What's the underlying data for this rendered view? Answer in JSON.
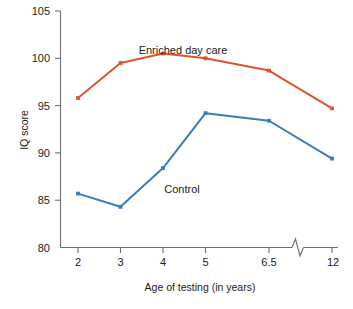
{
  "chart_data": {
    "type": "line",
    "title": "",
    "xlabel": "Age of testing (in years)",
    "ylabel": "IQ score",
    "categories": [
      "2",
      "3",
      "4",
      "5",
      "6.5",
      "12"
    ],
    "x_tick_labels": [
      "2",
      "3",
      "4",
      "5",
      "6.5",
      "12"
    ],
    "y_tick_labels": [
      "80",
      "85",
      "90",
      "95",
      "100",
      "105"
    ],
    "y_ticks": [
      80,
      85,
      90,
      95,
      100,
      105
    ],
    "ylim": [
      80,
      105
    ],
    "grid": false,
    "legend_position": "inline-annotation",
    "axis_break": "between 6.5 and 12 on x-axis",
    "series": [
      {
        "name": "Enriched day care",
        "color": "#e0522c",
        "values": [
          95.8,
          99.5,
          100.5,
          100.0,
          98.7,
          94.7
        ],
        "label_text": "Enriched day care"
      },
      {
        "name": "Control",
        "color": "#3a7cb8",
        "values": [
          85.7,
          84.3,
          88.4,
          94.2,
          93.4,
          89.4
        ],
        "label_text": "Control"
      }
    ],
    "annotations": [
      {
        "text": "Enriched day care",
        "series": "Enriched day care"
      },
      {
        "text": "Control",
        "series": "Control"
      }
    ]
  },
  "axis": {
    "y_label": "IQ score",
    "x_label": "Age of testing (in years)",
    "y_tick_105": "105",
    "y_tick_100": "100",
    "y_tick_95": "95",
    "y_tick_90": "90",
    "y_tick_85": "85",
    "y_tick_80": "80",
    "x_tick_2": "2",
    "x_tick_3": "3",
    "x_tick_4": "4",
    "x_tick_5": "5",
    "x_tick_65": "6.5",
    "x_tick_12": "12"
  },
  "colors": {
    "enriched": "#e0522c",
    "control": "#3a7cb8",
    "axis": "#6d6d6d",
    "text": "#1b1b1b",
    "background": "#ffffff"
  }
}
